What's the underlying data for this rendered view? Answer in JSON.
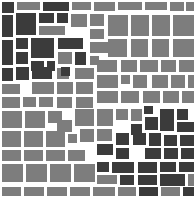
{
  "figure": {
    "name": "mosaic-tile-pattern",
    "width": 196,
    "height": 201,
    "background_color": "#ffffff"
  },
  "palette": {
    "dark": "#3b3b3b",
    "mid": "#7d7d7d",
    "background": "#ffffff"
  },
  "chart_data": {
    "type": "heatmap",
    "title": "",
    "subtitle": "",
    "xlabel": "",
    "ylabel": "",
    "grid": false,
    "legend_position": "none",
    "categories": [
      "dark",
      "mid"
    ],
    "values": [
      74,
      150
    ],
    "tiles": [
      {
        "x": 2,
        "y": 2,
        "w": 12,
        "h": 11,
        "shade": "dark"
      },
      {
        "x": 17,
        "y": 2,
        "w": 23,
        "h": 8,
        "shade": "mid"
      },
      {
        "x": 43,
        "y": 2,
        "w": 26,
        "h": 9,
        "shade": "dark"
      },
      {
        "x": 72,
        "y": 2,
        "w": 19,
        "h": 8,
        "shade": "mid"
      },
      {
        "x": 94,
        "y": 2,
        "w": 21,
        "h": 9,
        "shade": "mid"
      },
      {
        "x": 118,
        "y": 2,
        "w": 24,
        "h": 8,
        "shade": "mid"
      },
      {
        "x": 145,
        "y": 2,
        "w": 22,
        "h": 8,
        "shade": "mid"
      },
      {
        "x": 170,
        "y": 2,
        "w": 14,
        "h": 9,
        "shade": "mid"
      },
      {
        "x": 186,
        "y": 2,
        "w": 8,
        "h": 9,
        "shade": "mid"
      },
      {
        "x": 2,
        "y": 15,
        "w": 11,
        "h": 22,
        "shade": "dark"
      },
      {
        "x": 16,
        "y": 13,
        "w": 20,
        "h": 22,
        "shade": "dark"
      },
      {
        "x": 39,
        "y": 13,
        "w": 15,
        "h": 10,
        "shade": "dark"
      },
      {
        "x": 39,
        "y": 26,
        "w": 26,
        "h": 9,
        "shade": "mid"
      },
      {
        "x": 57,
        "y": 13,
        "w": 11,
        "h": 10,
        "shade": "dark"
      },
      {
        "x": 71,
        "y": 14,
        "w": 16,
        "h": 13,
        "shade": "mid"
      },
      {
        "x": 90,
        "y": 14,
        "w": 14,
        "h": 12,
        "shade": "mid"
      },
      {
        "x": 108,
        "y": 15,
        "w": 20,
        "h": 21,
        "shade": "mid"
      },
      {
        "x": 131,
        "y": 15,
        "w": 18,
        "h": 21,
        "shade": "mid"
      },
      {
        "x": 152,
        "y": 15,
        "w": 18,
        "h": 21,
        "shade": "mid"
      },
      {
        "x": 173,
        "y": 15,
        "w": 21,
        "h": 21,
        "shade": "mid"
      },
      {
        "x": 2,
        "y": 40,
        "w": 11,
        "h": 25,
        "shade": "dark"
      },
      {
        "x": 16,
        "y": 38,
        "w": 12,
        "h": 11,
        "shade": "dark"
      },
      {
        "x": 16,
        "y": 52,
        "w": 12,
        "h": 12,
        "shade": "dark"
      },
      {
        "x": 31,
        "y": 38,
        "w": 23,
        "h": 20,
        "shade": "dark"
      },
      {
        "x": 31,
        "y": 61,
        "w": 13,
        "h": 10,
        "shade": "dark"
      },
      {
        "x": 47,
        "y": 61,
        "w": 8,
        "h": 10,
        "shade": "dark"
      },
      {
        "x": 58,
        "y": 38,
        "w": 25,
        "h": 11,
        "shade": "dark"
      },
      {
        "x": 58,
        "y": 52,
        "w": 14,
        "h": 12,
        "shade": "mid"
      },
      {
        "x": 75,
        "y": 52,
        "w": 11,
        "h": 13,
        "shade": "dark"
      },
      {
        "x": 90,
        "y": 29,
        "w": 14,
        "h": 10,
        "shade": "mid"
      },
      {
        "x": 90,
        "y": 42,
        "w": 19,
        "h": 11,
        "shade": "mid"
      },
      {
        "x": 90,
        "y": 56,
        "w": 9,
        "h": 9,
        "shade": "mid"
      },
      {
        "x": 108,
        "y": 39,
        "w": 19,
        "h": 18,
        "shade": "mid"
      },
      {
        "x": 131,
        "y": 39,
        "w": 17,
        "h": 18,
        "shade": "mid"
      },
      {
        "x": 152,
        "y": 39,
        "w": 17,
        "h": 18,
        "shade": "mid"
      },
      {
        "x": 173,
        "y": 39,
        "w": 21,
        "h": 18,
        "shade": "mid"
      },
      {
        "x": 2,
        "y": 68,
        "w": 11,
        "h": 13,
        "shade": "dark"
      },
      {
        "x": 2,
        "y": 84,
        "w": 18,
        "h": 10,
        "shade": "mid"
      },
      {
        "x": 16,
        "y": 67,
        "w": 13,
        "h": 13,
        "shade": "dark"
      },
      {
        "x": 32,
        "y": 67,
        "w": 20,
        "h": 12,
        "shade": "dark"
      },
      {
        "x": 32,
        "y": 82,
        "w": 22,
        "h": 12,
        "shade": "mid"
      },
      {
        "x": 23,
        "y": 97,
        "w": 13,
        "h": 10,
        "shade": "mid"
      },
      {
        "x": 57,
        "y": 68,
        "w": 12,
        "h": 11,
        "shade": "mid"
      },
      {
        "x": 57,
        "y": 82,
        "w": 16,
        "h": 12,
        "shade": "mid"
      },
      {
        "x": 61,
        "y": 67,
        "w": 9,
        "h": 9,
        "shade": "dark"
      },
      {
        "x": 75,
        "y": 68,
        "w": 19,
        "h": 11,
        "shade": "mid"
      },
      {
        "x": 76,
        "y": 82,
        "w": 17,
        "h": 12,
        "shade": "mid"
      },
      {
        "x": 97,
        "y": 60,
        "w": 20,
        "h": 12,
        "shade": "mid"
      },
      {
        "x": 97,
        "y": 75,
        "w": 21,
        "h": 13,
        "shade": "mid"
      },
      {
        "x": 121,
        "y": 60,
        "w": 16,
        "h": 12,
        "shade": "mid"
      },
      {
        "x": 121,
        "y": 75,
        "w": 9,
        "h": 9,
        "shade": "mid"
      },
      {
        "x": 133,
        "y": 75,
        "w": 14,
        "h": 13,
        "shade": "mid"
      },
      {
        "x": 140,
        "y": 60,
        "w": 18,
        "h": 12,
        "shade": "mid"
      },
      {
        "x": 152,
        "y": 75,
        "w": 16,
        "h": 13,
        "shade": "mid"
      },
      {
        "x": 161,
        "y": 60,
        "w": 15,
        "h": 12,
        "shade": "mid"
      },
      {
        "x": 171,
        "y": 75,
        "w": 14,
        "h": 13,
        "shade": "mid"
      },
      {
        "x": 179,
        "y": 60,
        "w": 15,
        "h": 12,
        "shade": "mid"
      },
      {
        "x": 188,
        "y": 75,
        "w": 6,
        "h": 13,
        "shade": "mid"
      },
      {
        "x": 2,
        "y": 97,
        "w": 18,
        "h": 11,
        "shade": "mid"
      },
      {
        "x": 39,
        "y": 97,
        "w": 14,
        "h": 10,
        "shade": "mid"
      },
      {
        "x": 57,
        "y": 97,
        "w": 15,
        "h": 11,
        "shade": "mid"
      },
      {
        "x": 76,
        "y": 97,
        "w": 17,
        "h": 11,
        "shade": "mid"
      },
      {
        "x": 97,
        "y": 91,
        "w": 21,
        "h": 12,
        "shade": "mid"
      },
      {
        "x": 121,
        "y": 91,
        "w": 18,
        "h": 12,
        "shade": "mid"
      },
      {
        "x": 143,
        "y": 91,
        "w": 17,
        "h": 12,
        "shade": "mid"
      },
      {
        "x": 163,
        "y": 91,
        "w": 16,
        "h": 12,
        "shade": "mid"
      },
      {
        "x": 182,
        "y": 91,
        "w": 12,
        "h": 12,
        "shade": "mid"
      },
      {
        "x": 144,
        "y": 106,
        "w": 9,
        "h": 8,
        "shade": "dark"
      },
      {
        "x": 2,
        "y": 111,
        "w": 20,
        "h": 17,
        "shade": "mid"
      },
      {
        "x": 25,
        "y": 111,
        "w": 20,
        "h": 17,
        "shade": "mid"
      },
      {
        "x": 48,
        "y": 111,
        "w": 14,
        "h": 12,
        "shade": "mid"
      },
      {
        "x": 57,
        "y": 120,
        "w": 15,
        "h": 12,
        "shade": "mid"
      },
      {
        "x": 75,
        "y": 109,
        "w": 19,
        "h": 17,
        "shade": "mid"
      },
      {
        "x": 97,
        "y": 109,
        "w": 16,
        "h": 17,
        "shade": "mid"
      },
      {
        "x": 116,
        "y": 109,
        "w": 12,
        "h": 11,
        "shade": "mid"
      },
      {
        "x": 131,
        "y": 109,
        "w": 11,
        "h": 12,
        "shade": "mid"
      },
      {
        "x": 131,
        "y": 124,
        "w": 11,
        "h": 11,
        "shade": "dark"
      },
      {
        "x": 145,
        "y": 117,
        "w": 13,
        "h": 13,
        "shade": "dark"
      },
      {
        "x": 160,
        "y": 109,
        "w": 14,
        "h": 22,
        "shade": "dark"
      },
      {
        "x": 177,
        "y": 109,
        "w": 11,
        "h": 11,
        "shade": "dark"
      },
      {
        "x": 177,
        "y": 122,
        "w": 17,
        "h": 10,
        "shade": "dark"
      },
      {
        "x": 2,
        "y": 131,
        "w": 19,
        "h": 16,
        "shade": "mid"
      },
      {
        "x": 24,
        "y": 131,
        "w": 19,
        "h": 16,
        "shade": "mid"
      },
      {
        "x": 46,
        "y": 131,
        "w": 19,
        "h": 16,
        "shade": "mid"
      },
      {
        "x": 68,
        "y": 134,
        "w": 9,
        "h": 9,
        "shade": "mid"
      },
      {
        "x": 80,
        "y": 129,
        "w": 14,
        "h": 13,
        "shade": "mid"
      },
      {
        "x": 97,
        "y": 129,
        "w": 15,
        "h": 12,
        "shade": "mid"
      },
      {
        "x": 97,
        "y": 144,
        "w": 16,
        "h": 11,
        "shade": "dark"
      },
      {
        "x": 116,
        "y": 133,
        "w": 13,
        "h": 12,
        "shade": "dark"
      },
      {
        "x": 116,
        "y": 148,
        "w": 13,
        "h": 11,
        "shade": "dark"
      },
      {
        "x": 133,
        "y": 133,
        "w": 13,
        "h": 12,
        "shade": "dark"
      },
      {
        "x": 149,
        "y": 133,
        "w": 12,
        "h": 13,
        "shade": "dark"
      },
      {
        "x": 145,
        "y": 148,
        "w": 16,
        "h": 11,
        "shade": "dark"
      },
      {
        "x": 164,
        "y": 135,
        "w": 13,
        "h": 11,
        "shade": "dark"
      },
      {
        "x": 164,
        "y": 148,
        "w": 14,
        "h": 11,
        "shade": "dark"
      },
      {
        "x": 180,
        "y": 135,
        "w": 14,
        "h": 11,
        "shade": "dark"
      },
      {
        "x": 181,
        "y": 148,
        "w": 13,
        "h": 11,
        "shade": "dark"
      },
      {
        "x": 2,
        "y": 150,
        "w": 19,
        "h": 11,
        "shade": "mid"
      },
      {
        "x": 24,
        "y": 150,
        "w": 19,
        "h": 11,
        "shade": "mid"
      },
      {
        "x": 46,
        "y": 150,
        "w": 19,
        "h": 11,
        "shade": "mid"
      },
      {
        "x": 68,
        "y": 150,
        "w": 17,
        "h": 11,
        "shade": "mid"
      },
      {
        "x": 2,
        "y": 164,
        "w": 21,
        "h": 18,
        "shade": "mid"
      },
      {
        "x": 26,
        "y": 164,
        "w": 21,
        "h": 18,
        "shade": "mid"
      },
      {
        "x": 50,
        "y": 164,
        "w": 21,
        "h": 18,
        "shade": "mid"
      },
      {
        "x": 74,
        "y": 164,
        "w": 21,
        "h": 18,
        "shade": "mid"
      },
      {
        "x": 97,
        "y": 162,
        "w": 12,
        "h": 10,
        "shade": "dark"
      },
      {
        "x": 97,
        "y": 175,
        "w": 20,
        "h": 9,
        "shade": "mid"
      },
      {
        "x": 112,
        "y": 162,
        "w": 22,
        "h": 11,
        "shade": "dark"
      },
      {
        "x": 120,
        "y": 175,
        "w": 14,
        "h": 10,
        "shade": "dark"
      },
      {
        "x": 138,
        "y": 162,
        "w": 19,
        "h": 11,
        "shade": "dark"
      },
      {
        "x": 138,
        "y": 175,
        "w": 19,
        "h": 10,
        "shade": "dark"
      },
      {
        "x": 160,
        "y": 162,
        "w": 16,
        "h": 10,
        "shade": "dark"
      },
      {
        "x": 160,
        "y": 174,
        "w": 25,
        "h": 12,
        "shade": "dark"
      },
      {
        "x": 179,
        "y": 162,
        "w": 15,
        "h": 10,
        "shade": "dark"
      },
      {
        "x": 188,
        "y": 174,
        "w": 6,
        "h": 12,
        "shade": "mid"
      },
      {
        "x": 2,
        "y": 187,
        "w": 19,
        "h": 9,
        "shade": "mid"
      },
      {
        "x": 24,
        "y": 187,
        "w": 20,
        "h": 9,
        "shade": "mid"
      },
      {
        "x": 47,
        "y": 187,
        "w": 20,
        "h": 9,
        "shade": "mid"
      },
      {
        "x": 70,
        "y": 187,
        "w": 20,
        "h": 9,
        "shade": "mid"
      },
      {
        "x": 93,
        "y": 187,
        "w": 22,
        "h": 9,
        "shade": "mid"
      },
      {
        "x": 118,
        "y": 187,
        "w": 18,
        "h": 9,
        "shade": "mid"
      },
      {
        "x": 139,
        "y": 187,
        "w": 19,
        "h": 9,
        "shade": "dark"
      },
      {
        "x": 161,
        "y": 187,
        "w": 19,
        "h": 9,
        "shade": "mid"
      },
      {
        "x": 183,
        "y": 187,
        "w": 11,
        "h": 9,
        "shade": "dark"
      }
    ]
  }
}
